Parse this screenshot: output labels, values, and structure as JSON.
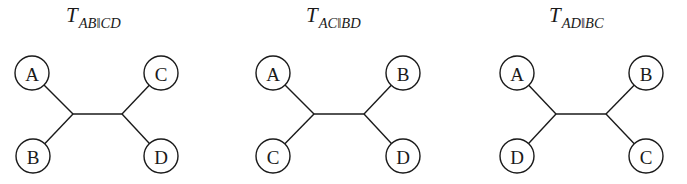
{
  "figure": {
    "trees": [
      {
        "title_main": "T",
        "title_sub": "AB‖CD",
        "split": "AB|CD",
        "title_x": 66,
        "left_joint": [
          73,
          114
        ],
        "right_joint": [
          122,
          114
        ],
        "nodes": [
          {
            "label": "A",
            "position": "top-left",
            "cx": 32,
            "cy": 73
          },
          {
            "label": "B",
            "position": "bottom-left",
            "cx": 33,
            "cy": 156
          },
          {
            "label": "C",
            "position": "top-right",
            "cx": 161,
            "cy": 73
          },
          {
            "label": "D",
            "position": "bottom-right",
            "cx": 161,
            "cy": 156
          }
        ]
      },
      {
        "title_main": "T",
        "title_sub": "AC‖BD",
        "split": "AC|BD",
        "title_x": 306,
        "left_joint": [
          314,
          114
        ],
        "right_joint": [
          364,
          114
        ],
        "nodes": [
          {
            "label": "A",
            "position": "top-left",
            "cx": 273,
            "cy": 73
          },
          {
            "label": "C",
            "position": "bottom-left",
            "cx": 273,
            "cy": 156
          },
          {
            "label": "B",
            "position": "top-right",
            "cx": 403,
            "cy": 73
          },
          {
            "label": "D",
            "position": "bottom-right",
            "cx": 403,
            "cy": 156
          }
        ]
      },
      {
        "title_main": "T",
        "title_sub": "AD‖BC",
        "split": "AD|BC",
        "title_x": 549,
        "left_joint": [
          556,
          114
        ],
        "right_joint": [
          606,
          114
        ],
        "nodes": [
          {
            "label": "A",
            "position": "top-left",
            "cx": 517,
            "cy": 73
          },
          {
            "label": "D",
            "position": "bottom-left",
            "cx": 517,
            "cy": 156
          },
          {
            "label": "B",
            "position": "top-right",
            "cx": 646,
            "cy": 73
          },
          {
            "label": "C",
            "position": "bottom-right",
            "cx": 646,
            "cy": 156
          }
        ]
      }
    ],
    "node_radius": 17,
    "stroke_color": "#1a1a1a",
    "background": "#ffffff"
  }
}
